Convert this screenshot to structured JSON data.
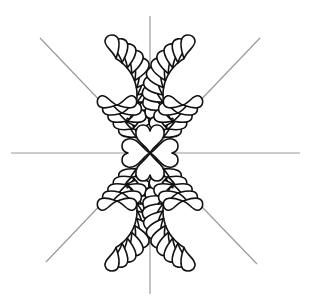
{
  "colors": {
    "background": "#ffffff",
    "outline": "#111111",
    "guide": "#9a9a9a"
  },
  "guides": {
    "center": [
      150,
      153
    ],
    "vertical": {
      "x": 150,
      "y1": 16,
      "y2": 294
    },
    "horizontal": {
      "y": 153,
      "x1": 11,
      "x2": 300
    },
    "diagonals": [
      {
        "x1": 40,
        "y1": 38,
        "x2": 150,
        "y2": 153
      },
      {
        "x1": 260,
        "y1": 38,
        "x2": 150,
        "y2": 153
      },
      {
        "x1": 46,
        "y1": 262,
        "x2": 150,
        "y2": 153
      },
      {
        "x1": 257,
        "y1": 264,
        "x2": 150,
        "y2": 153
      }
    ]
  },
  "center_rosette": {
    "petals": 4,
    "shape": "heart"
  },
  "feathers": [
    {
      "name": "top-left",
      "mirror_x": 1,
      "mirror_y": 1
    },
    {
      "name": "top-right",
      "mirror_x": -1,
      "mirror_y": 1
    },
    {
      "name": "bottom-left",
      "mirror_x": 1,
      "mirror_y": -1
    },
    {
      "name": "bottom-right",
      "mirror_x": -1,
      "mirror_y": -1
    }
  ],
  "feather_spine": {
    "center": [
      95,
      95
    ],
    "radius": 42,
    "start_deg": 40,
    "end_deg": 300,
    "plume_count": 11,
    "plume_length": 24,
    "plume_width": 15
  }
}
